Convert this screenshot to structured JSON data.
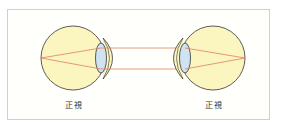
{
  "diagram": {
    "title": "",
    "eyes": [
      {
        "id": "left",
        "label": "正視",
        "facing": "right"
      },
      {
        "id": "right",
        "label": "正視",
        "facing": "left"
      }
    ],
    "colors": {
      "eyeball_fill": "#fbf5c0",
      "outline": "#333333",
      "lens_fill": "#cfe3f1",
      "ray": "#e0805f",
      "frame_border": "#c9d2dc"
    }
  }
}
